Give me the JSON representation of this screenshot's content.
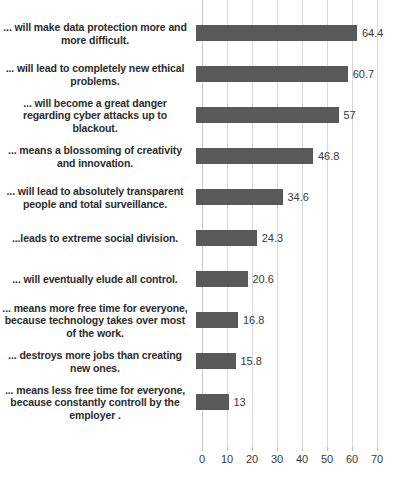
{
  "chart_data": {
    "type": "bar",
    "orientation": "horizontal",
    "title": "",
    "xlabel": "",
    "ylabel": "",
    "xlim": [
      0,
      70
    ],
    "xticks": [
      0,
      10,
      20,
      30,
      40,
      50,
      60,
      70
    ],
    "grid": true,
    "legend": false,
    "bar_color": "#595959",
    "gridline_color": "#d9d9d9",
    "categories": [
      "... will make data protection more and more difficult.",
      "... will lead to completely new ethical problems.",
      "... will become a great danger regarding cyber attacks up to blackout.",
      "... means a blossoming of creativity and innovation.",
      "... will lead to absolutely transparent people and total surveillance.",
      "...leads to extreme social division.",
      "... will eventually elude all control.",
      "... means more free time for everyone, because technology takes over most of the work.",
      "... destroys more jobs than creating new ones.",
      "... means less free time for everyone, because  constantly controll by the employer ."
    ],
    "values": [
      64.4,
      60.7,
      57,
      46.8,
      34.6,
      24.3,
      20.6,
      16.8,
      15.8,
      13
    ],
    "value_labels": [
      "64.4",
      "60.7",
      "57",
      "46.8",
      "34.6",
      "24.3",
      "20.6",
      "16.8",
      "15.8",
      "13"
    ],
    "tick_labels": [
      "0",
      "10",
      "20",
      "30",
      "40",
      "50",
      "60",
      "70"
    ]
  }
}
